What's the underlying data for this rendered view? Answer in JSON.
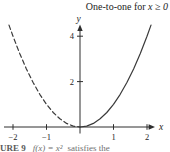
{
  "figure": {
    "annotation": "One-to-one for ",
    "annotation_math": "x ≥ 0",
    "caption": {
      "figure_label": "URE 9",
      "math": "f(x) = x²",
      "text": "satisfies the"
    }
  },
  "chart_data": {
    "type": "line",
    "title": "One-to-one for x ≥ 0",
    "xlabel": "x",
    "ylabel": "y",
    "xlim": [
      -2.3,
      2.4
    ],
    "ylim": [
      0,
      4.7
    ],
    "grid": false,
    "x_ticks": [
      -2,
      -1,
      1,
      2
    ],
    "x_tick_labels": [
      "−2",
      "−1",
      "1",
      "2"
    ],
    "y_ticks": [
      2,
      4
    ],
    "y_tick_labels": [
      "2",
      "4"
    ],
    "colors": {
      "curve": "#3a3a3a",
      "axis": "#2e2e2e",
      "tick_text": "#262626"
    },
    "series": [
      {
        "name": "f(x) = x² for x < 0 (dashed, fails one-to-one)",
        "style": "dashed",
        "points": [
          [
            -2.12,
            4.49
          ],
          [
            -2.0,
            4.0
          ],
          [
            -1.8,
            3.24
          ],
          [
            -1.6,
            2.56
          ],
          [
            -1.4,
            1.96
          ],
          [
            -1.2,
            1.44
          ],
          [
            -1.0,
            1.0
          ],
          [
            -0.8,
            0.64
          ],
          [
            -0.6,
            0.36
          ],
          [
            -0.4,
            0.16
          ],
          [
            -0.2,
            0.04
          ],
          [
            0,
            0
          ]
        ]
      },
      {
        "name": "f(x) = x² for x ≥ 0 (solid, one-to-one)",
        "style": "solid",
        "points": [
          [
            0,
            0
          ],
          [
            0.2,
            0.04
          ],
          [
            0.4,
            0.16
          ],
          [
            0.6,
            0.36
          ],
          [
            0.8,
            0.64
          ],
          [
            1.0,
            1.0
          ],
          [
            1.2,
            1.44
          ],
          [
            1.4,
            1.96
          ],
          [
            1.6,
            2.56
          ],
          [
            1.8,
            3.24
          ],
          [
            2.0,
            4.0
          ],
          [
            2.12,
            4.49
          ]
        ]
      }
    ]
  }
}
